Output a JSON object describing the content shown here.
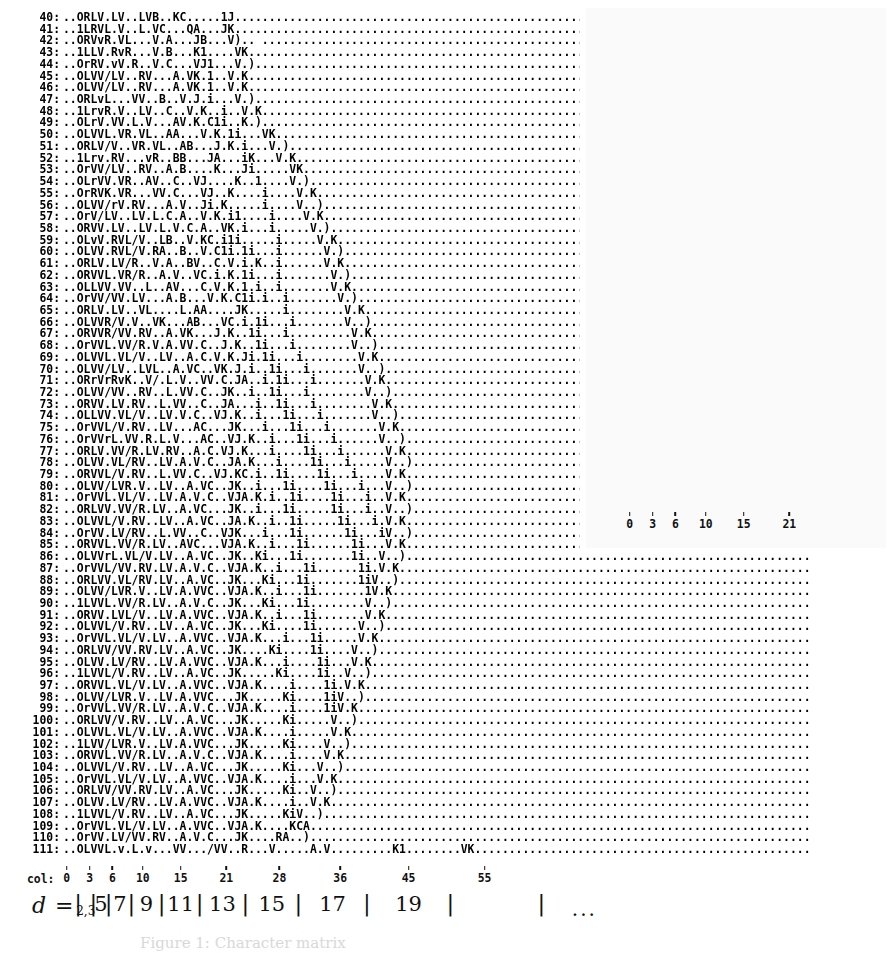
{
  "figure": {
    "kind": "character-matrix-plot",
    "caption_stub": "Figure 1: Character matrix",
    "col_axis_label": "col:",
    "d_axis_label": "d =",
    "d_axis_trailing": "..."
  },
  "main": {
    "row_first": 40,
    "row_last": 111,
    "row_separator": ":",
    "col_ticks": [
      {
        "label": "0",
        "col": 0
      },
      {
        "label": "3",
        "col": 3
      },
      {
        "label": "6",
        "col": 6
      },
      {
        "label": "10",
        "col": 10
      },
      {
        "label": "15",
        "col": 15
      },
      {
        "label": "21",
        "col": 21
      },
      {
        "label": "28",
        "col": 28
      },
      {
        "label": "36",
        "col": 36
      },
      {
        "label": "45",
        "col": 45
      },
      {
        "label": "55",
        "col": 55
      }
    ],
    "rows": [
      "..ORLV.LV..LVB..KC.....1J...............................................",
      "..1LRVL.V..L.VC...QA...JK...............................................",
      "..ORVvR.VL...V.A...JB...V).. ...........................................",
      "..1LLV.RvR...V.B...K1....VK.............................................",
      "..OrRV.vV.R..V.C...VJ1...V.)............................................",
      "..OLVV/LV..RV...A.VK.1..V.K.............................................",
      "..OLVV/LV..RV...A.VK.1..V.K.............................................",
      "..ORLvL...VV..B..V.J.i...V.)............................................",
      "..1LrvR.V..LV..C..V.K..i..V.K...........................................",
      "..OLrV.VV.L.V...AV.K.C1i..K.)...........................................",
      "..OLVVL.VR.VL..AA...V.K.1i...VK.........................................",
      "..ORLV/V..VR.VL..AB...J.K.i...V.)......................................",
      "..1Lrv.RV...vR..BB...JA...iK...V.K......................................",
      "..OrVV/LV..RV..A.B....K...Ji.....VK.....................................",
      "..OLrVV.VR..AV..C..VJ....K..1....V.)....................................",
      "..OrRVK.VR...VV.C...VJ..K....i....V.K...................................",
      "..OLVV/rV.RV...A.V..Ji.K.....i....V..)..................................",
      "..OrV/LV..LV.L.C.A..V.K.i1....i....V.K..................................",
      "..ORVV.LV..LV.L.V.C.A..VK.i...i.....V.)................................",
      "..OLvV.RVL/V..LB..V.KC.i1i.....i.....V.K...............................",
      "..OLVV.RVL/V.RA..B..V.C1i.1i...i......V.)..............................",
      "..ORLV.LV/R..V.A..BV..C.V.i.K..i......V.K..............................",
      "..ORVVL.VR/R..A.V..VC.i.K.1i...i.......V.)............................",
      "..OLLVV.VV..L..AV...C.V.K.1.i..i.......V.K............................",
      "..OrVV/VV.LV...A.B...V.K.C1i.i..i.......V.)...........................",
      "..ORLV.LV..VL....L.AA....JK.....i........V.K..........................",
      "..OLVVR/V.V..VK...AB...VC.i.1i...i.......V..).........................",
      "..ORVVR/VV.RV..A.VK...J.K..1i...i.........V.K.........................",
      "..OrVVL.VV/R.V.A.VV.C..J.K..1i...i........V..)........................",
      "..OLVVL.VL/V..LV..A.C.V.K.Ji.1i...i........V.K........................",
      "..OLVV/LV..LVL..A.VC..VK.J.i..1i...i.......V..).......................",
      "..ORrVrRvK..V/.L.V..VV.C.JA..i.1i...i.......V.K.......................",
      "..OLVV/VV..RV..L.VV.C..JK..i..1i...i........V..)......................",
      "..ORVV.LV.RV..L.VV..C..JA...i..1i...i........V.K......................",
      "..OLLVV.VL/V..LV.V.C..VJ.K..i...1i...i.......V..).....................",
      "..OrVVL/V.RV..LV...AC...JK...i...1i...i.......V.K.....................",
      "..OrVVrL.VV.R.L.V...AC..VJ.K..i...1i...i......V..)....................",
      "..ORLV.VV/R.LV.RV..A.C.VJ.K...i....1i...i......V.K....................",
      "..OLVV.VL/RV..LV.A.V.C..JA.K...i....1i...i.....V..)...................",
      "..ORVVL/V.RV..L.VV.C..VJ.KC.i..1i....1i...i....V.K....................",
      "..OLVV/LVR.V..LV..A.VC..JK..i...1i....1i...i...V..)...................",
      "..OrVVL.VL/V..LV.A.V.C..VJA.K.i..1i....1i...i..V.K....................",
      "..ORLVV.VV/R.LV..A.VC...JK..i...1i.....1i...i..V..)...................",
      "..OLVVL/V.RV..LV..A.VC..JA.K..i..1i.....1i...i.V.K....................",
      "..OrVV.LV/RV..L.VV..C..VJK...i...1i......1i...iV..)...................",
      "..ORVVL.VV/R.LV..AVC...VJA.K..i...1i......1i...V.K....................",
      "..OLVVrL.VL/V.LV..A.VC..JK..Ki...1i.......1i..V..)....................",
      "..OrVVL/VV.RV.LV.A.V.C..VJA.K..i...1i......1i.V.K.....................",
      "..ORLVV.VL/RV.LV..A.VC..JK...Ki...1i.......1iV..).....................",
      "..OLVV/LVR.V..LV.A.VVC..VJA.K..i...1i.......1V.K......................",
      "..1LVVL.VV/R.LV..A.V.C..JK...Ki...1i........V..)......................",
      "..ORVV.LVL/V..LV.A.VVC..VJA.K..i...1i.......V.K.......................",
      "..OLVVL/V.RV..LV..A.VC..JK...Ki....1i......V..).......................",
      "..OrVVL.VL/V.LV..A.VVC..VJA.K...i...1i.....V.K........................",
      "..ORLVV/VV.RV.LV..A.VC..JK....Ki....1i....V..)........................",
      "..OLVV.LV/RV..LV.A.VVC..VJA.K...i....1i...V.K.........................",
      "..1LVVL/V.RV..LV..A.VC..JK.....Ki....1i..V..).........................",
      "..ORVVL.VL/V.LV..A.VVC..VJA.K....i....1i.V.K..........................",
      "..OLVV/LVR.V..LV.A.VVC...JK.....Ki....1iV..)..........................",
      "..OrVVL.VV/R.LV..A.V.C..VJA.K....i....1iV.K...........................",
      "..ORLVV/V.RV..LV..A.VC...JK.....Ki.....V..)...........................",
      "..OLVVL.VL/V.LV..A.VVC..VJA.K....i.....V.K............................",
      "..1LVV/LVR.V..LV.A.VVC...JK.....Ki....V..)............................",
      "..ORVVL.VV/R.LV..A.V.C..VJA.K....i....V.K.............................",
      "..OLVVL/V.RV..LV..A.VC...JK.....Ki...V..).............................",
      "..OrVVL.VL/V.LV..A.VVC..VJA.K....i...V.K..............................",
      "..ORLVV/VV.RV.LV..A.VC...JK.....Ki..V..)..............................",
      "..OLVV.LV/RV..LV.A.VVC..VJA.K....i..V.K...............................",
      "..1LVVL/V.RV..LV..A.VC...JK.....KiV..)................................",
      "..OrVVL.VL/V.LV..A.VVC..VJA.K....KCA..................................",
      "..OrVV.LV/VV.RV..A.V.C...JK....RA..)..................................",
      "..OLVVL.v.L.v...VV.../VV..R...V.....A.V.........K1........VK.........."
    ]
  },
  "inset": {
    "row_first": 0,
    "row_last": 40,
    "row_separator": ":",
    "col_ticks": [
      {
        "label": "0",
        "col": 0
      },
      {
        "label": "3",
        "col": 3
      },
      {
        "label": "6",
        "col": 6
      },
      {
        "label": "10",
        "col": 10
      },
      {
        "label": "15",
        "col": 15
      },
      {
        "label": "21",
        "col": 21
      }
    ],
    "rows": [
      "..O.......................",
      "..OK).....................",
      "..1AJ.....................",
      "..1BK.....................",
      "..OR.J....................",
      "..1LOK)...................",
      "..OR.AJ...................",
      "..1LLBK)..................",
      "..OrO1.J..................",
      "..OLVOiK).................",
      "..ORRCO1J.................",
      "..OrLJB.V.)...............",
      "..1LrV.KJ.)...............",
      "..OrVJ.1V.J...............",
      "..ORLVVK.C.i.K............",
      "..ORLVA.V1.1K.............",
      "..1Lrv.VBK.V1K............",
      "..OrVV.VB.RA.iK...........",
      "..1LLVAAOA..J.)...........",
      "..OrLVV.LJB..JK...........",
      "..OrRV.LVB..VJ)...........",
      "..OLVVL.K1..VK............",
      "..ORLvR.VJi.V.)...........",
      "..1LrV.RVK.iV.K...........",
      "..OrVV.VQ.JCi..)..........",
      "..OLLV.LCBK.Vi.K..........",
      "..OrRVL.VR.RA.V1K.........",
      "..1LrV.VVB.RA..iK.........",
      "..ORLV.RVC.KC....1K.......",
      "..OrVV.VV.A.QA....J.).....",
      "..ORVV.LVV.RA.VJ....iK....",
      "..1LLVL.V.V.A.J1.....J....",
      "..OrRVV.V.A.VJ1......V.)..",
      "..OLvV.RV..LCK.1.V.K......",
      "..OrLVV.VV.A.AJ.1.V.K.....",
      "..ORLV.LV..BAK.Q1.K.......",
      "..ORVVL.V.LAAJ.1V.K.......",
      "..1LLvR/VR.RB.K.V.1K......",
      "..OrVV/RV.ACB..1V.)K......",
      "..OrLVV.VV..VVA..JA....1K.",
      "..ORLV.LV..LVB..KC....1J.."
    ]
  }
}
